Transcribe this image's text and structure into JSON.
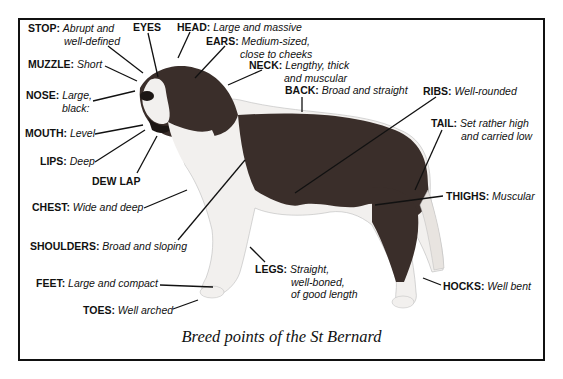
{
  "diagram": {
    "caption": "Breed points of the St Bernard",
    "labels": {
      "stop": {
        "key": "STOP:",
        "line1": "Abrupt and",
        "line2": "well-defined"
      },
      "eyes": {
        "key": "EYES"
      },
      "head": {
        "key": "HEAD:",
        "line1": "Large and massive"
      },
      "ears": {
        "key": "EARS:",
        "line1": "Medium-sized,",
        "line2": "close to cheeks"
      },
      "neck": {
        "key": "NECK:",
        "line1": "Lengthy, thick",
        "line2": "and muscular"
      },
      "back": {
        "key": "BACK:",
        "line1": "Broad and straight"
      },
      "ribs": {
        "key": "RIBS:",
        "line1": "Well-rounded"
      },
      "tail": {
        "key": "TAIL:",
        "line1": "Set rather high",
        "line2": "and carried low"
      },
      "thighs": {
        "key": "THIGHS:",
        "line1": "Muscular"
      },
      "muzzle": {
        "key": "MUZZLE:",
        "line1": "Short"
      },
      "nose": {
        "key": "NOSE:",
        "line1": "Large,",
        "line2": "black:"
      },
      "mouth": {
        "key": "MOUTH:",
        "line1": "Level"
      },
      "lips": {
        "key": "LIPS:",
        "line1": "Deep"
      },
      "dew_lap": {
        "key": "DEW LAP"
      },
      "chest": {
        "key": "CHEST:",
        "line1": "Wide and deep"
      },
      "shoulders": {
        "key": "SHOULDERS:",
        "line1": "Broad and sloping"
      },
      "legs": {
        "key": "LEGS:",
        "line1": "Straight,",
        "line2": "well-boned,",
        "line3": "of good length"
      },
      "feet": {
        "key": "FEET:",
        "line1": "Large and compact"
      },
      "toes": {
        "key": "TOES:",
        "line1": "Well arched"
      },
      "hocks": {
        "key": "HOCKS:",
        "line1": "Well bent"
      }
    },
    "colors": {
      "frame": "#111111",
      "coat_dark": "#3a2e2a",
      "coat_light": "#f2f0ee",
      "background": "#ffffff"
    }
  }
}
